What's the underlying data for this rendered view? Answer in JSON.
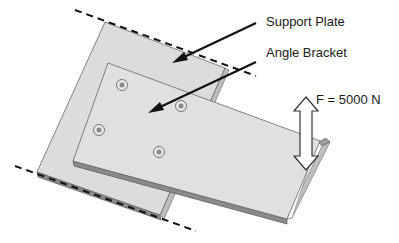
{
  "diagram": {
    "labels": {
      "support_plate": "Support Plate",
      "angle_bracket": "Angle Bracket",
      "force": "F = 5000 N"
    },
    "components": [
      {
        "id": "support-plate",
        "type": "plate",
        "fixed_edges": "dashed lines top and bottom"
      },
      {
        "id": "angle-bracket",
        "type": "bracket",
        "bolts": 4
      },
      {
        "id": "force-arrow",
        "type": "double-arrow",
        "value": "5000 N"
      }
    ],
    "bolt_count": 4,
    "colors": {
      "plate_fill": "#dcdcdc",
      "bracket_fill": "#e2e2e2",
      "edge": "#555555",
      "arrow": "#111111"
    }
  }
}
